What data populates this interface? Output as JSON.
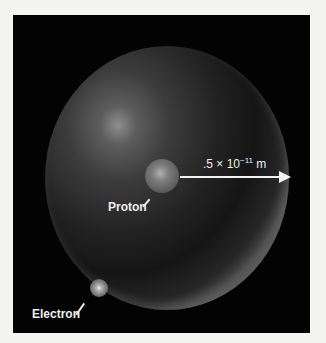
{
  "diagram": {
    "labels": {
      "proton": "Proton",
      "electron": "Electron",
      "radius_prefix": ".5 × 10",
      "radius_exponent": "−11",
      "radius_unit": " m"
    },
    "colors": {
      "background": "#030303",
      "page": "#f4f4f2",
      "text": "#ededed",
      "arrow": "#f2f2f2"
    }
  }
}
